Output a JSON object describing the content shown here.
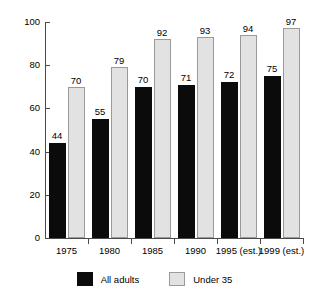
{
  "chart_data": {
    "type": "bar",
    "title": "",
    "xlabel": "",
    "ylabel": "",
    "ylim": [
      0,
      100
    ],
    "yticks": [
      0,
      20,
      40,
      60,
      80,
      100
    ],
    "grid": false,
    "legend_position": "bottom",
    "categories": [
      "1975",
      "1980",
      "1985",
      "1990",
      "1995 (est.)",
      "1999 (est.)"
    ],
    "series": [
      {
        "name": "All adults",
        "color": "#0b0b0b",
        "values": [
          44,
          55,
          70,
          71,
          72,
          75
        ]
      },
      {
        "name": "Under 35",
        "color": "#e2e2e2",
        "values": [
          70,
          79,
          92,
          93,
          94,
          97
        ]
      }
    ]
  },
  "axis": {
    "y_tick_labels": [
      "0",
      "20",
      "40",
      "60",
      "80",
      "100"
    ]
  },
  "legend": {
    "items": [
      {
        "label": "All adults",
        "swatch": "dark"
      },
      {
        "label": "Under 35",
        "swatch": "light"
      }
    ]
  },
  "title_remnant": ""
}
